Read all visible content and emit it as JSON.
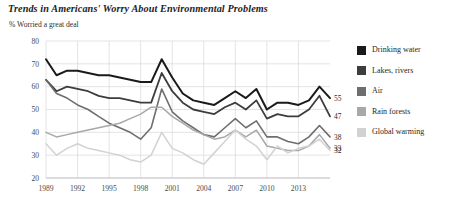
{
  "header": {
    "title": "Trends in Americans' Worry About Environmental Problems",
    "subtitle": "% Worried a great deal"
  },
  "legend": {
    "position": "right",
    "items": [
      {
        "label": "Drinking water",
        "color": "#1a1a1a"
      },
      {
        "label": "Lakes, rivers",
        "color": "#3d3d3d"
      },
      {
        "label": "Air",
        "color": "#6e6e6e"
      },
      {
        "label": "Rain forests",
        "color": "#a8a8a8"
      },
      {
        "label": "Global warming",
        "color": "#d2d2d2"
      }
    ]
  },
  "chart_data": {
    "type": "line",
    "title": "Trends in Americans' Worry About Environmental Problems",
    "subtitle": "% Worried a great deal",
    "xlabel": "",
    "ylabel": "% Worried a great deal",
    "ylim": [
      20,
      80
    ],
    "yticks": [
      20,
      30,
      40,
      50,
      60,
      70,
      80
    ],
    "xlim": [
      1989,
      2016
    ],
    "xticks": [
      1989,
      1992,
      1995,
      1998,
      2001,
      2004,
      2007,
      2010,
      2013
    ],
    "grid": true,
    "x": [
      1989,
      1990,
      1991,
      1992,
      1993,
      1994,
      1995,
      1996,
      1997,
      1998,
      1999,
      2000,
      2001,
      2002,
      2003,
      2004,
      2005,
      2006,
      2007,
      2008,
      2009,
      2010,
      2011,
      2012,
      2013,
      2014,
      2015,
      2016
    ],
    "series": [
      {
        "name": "Drinking water",
        "color": "#1a1a1a",
        "end_label": "55",
        "values": [
          72,
          65,
          67,
          67,
          66,
          65,
          65,
          64,
          63,
          62,
          62,
          72,
          64,
          57,
          54,
          53,
          52,
          55,
          58,
          55,
          59,
          50,
          53,
          53,
          52,
          54,
          60,
          55
        ]
      },
      {
        "name": "Lakes, rivers",
        "color": "#3d3d3d",
        "end_label": "47",
        "values": [
          63,
          58,
          60,
          59,
          58,
          56,
          55,
          55,
          54,
          53,
          53,
          66,
          58,
          53,
          50,
          49,
          48,
          51,
          53,
          50,
          54,
          46,
          48,
          47,
          47,
          50,
          56,
          47
        ]
      },
      {
        "name": "Air",
        "color": "#6e6e6e",
        "end_label": "38",
        "values": [
          63,
          57,
          55,
          52,
          50,
          47,
          44,
          42,
          40,
          37,
          42,
          59,
          49,
          45,
          42,
          39,
          38,
          42,
          46,
          42,
          45,
          38,
          38,
          36,
          35,
          38,
          43,
          38
        ]
      },
      {
        "name": "Rain forests",
        "color": "#a8a8a8",
        "end_label": "33",
        "values": [
          40,
          38,
          39,
          40,
          41,
          42,
          43,
          44,
          46,
          48,
          51,
          51,
          47,
          44,
          41,
          39,
          37,
          38,
          41,
          38,
          41,
          34,
          33,
          32,
          32,
          34,
          39,
          33
        ]
      },
      {
        "name": "Global warming",
        "color": "#d2d2d2",
        "end_label": "32",
        "values": [
          35,
          30,
          33,
          35,
          33,
          32,
          31,
          30,
          28,
          27,
          30,
          40,
          33,
          31,
          28,
          26,
          31,
          36,
          41,
          37,
          34,
          28,
          34,
          31,
          33,
          34,
          37,
          32
        ]
      }
    ]
  }
}
